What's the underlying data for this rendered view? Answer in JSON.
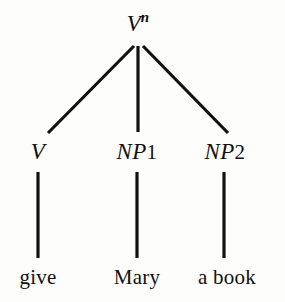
{
  "figure": {
    "kind": "syntax-tree",
    "background_color": "#fdfdfb",
    "ink_color": "#111111",
    "width": 285,
    "height": 302
  },
  "tree": {
    "root": {
      "id": "root",
      "base": "V",
      "superscript": "n",
      "full_text": "Vn",
      "x": 138,
      "baseline_y": 35
    },
    "nonterminals": [
      {
        "id": "v",
        "base": "V",
        "index": "",
        "full_text": "V",
        "x": 38,
        "baseline_y": 163
      },
      {
        "id": "np1",
        "base": "NP",
        "index": "1",
        "full_text": "NP1",
        "x": 137,
        "baseline_y": 163
      },
      {
        "id": "np2",
        "base": "NP",
        "index": "2",
        "full_text": "NP2",
        "x": 225,
        "baseline_y": 163
      }
    ],
    "leaves": [
      {
        "id": "leaf-give",
        "text": "give",
        "x": 38,
        "baseline_y": 288
      },
      {
        "id": "leaf-mary",
        "text": "Mary",
        "x": 137,
        "baseline_y": 288
      },
      {
        "id": "leaf-a-book",
        "text": "a book",
        "x": 227,
        "baseline_y": 288
      }
    ],
    "edges": [
      {
        "id": "edge-root-v",
        "from": "root",
        "to": "v",
        "x1": 134,
        "y1": 46,
        "x2": 48,
        "y2": 133
      },
      {
        "id": "edge-root-np1",
        "from": "root",
        "to": "np1",
        "x1": 138,
        "y1": 46,
        "x2": 138,
        "y2": 132
      },
      {
        "id": "edge-root-np2",
        "from": "root",
        "to": "np2",
        "x1": 143,
        "y1": 46,
        "x2": 228,
        "y2": 133
      },
      {
        "id": "edge-v-give",
        "from": "v",
        "to": "leaf-give",
        "x1": 38,
        "y1": 172,
        "x2": 38,
        "y2": 258
      },
      {
        "id": "edge-np1-mary",
        "from": "np1",
        "to": "leaf-mary",
        "x1": 137,
        "y1": 172,
        "x2": 137,
        "y2": 258
      },
      {
        "id": "edge-np2-abook",
        "from": "np2",
        "to": "leaf-a-book",
        "x1": 224,
        "y1": 172,
        "x2": 224,
        "y2": 258
      }
    ],
    "edge_stroke_width": 3.2
  }
}
